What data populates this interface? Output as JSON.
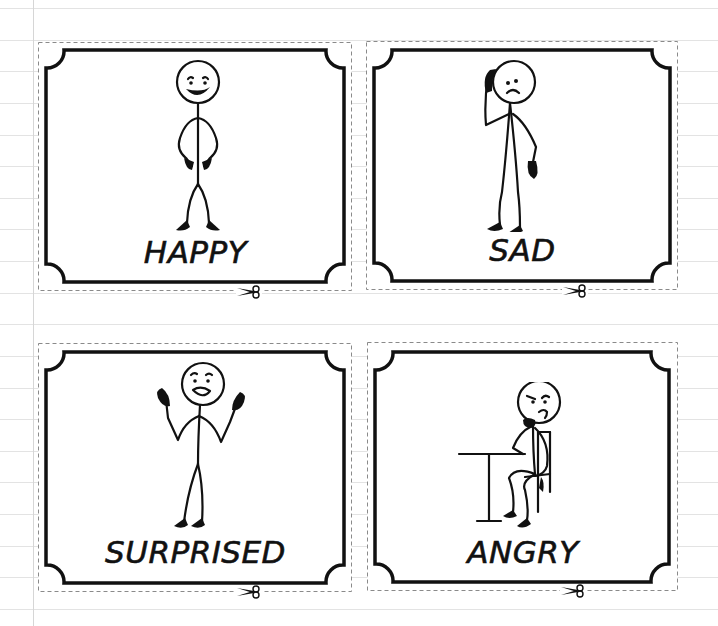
{
  "page": {
    "background": "#ffffff",
    "ruled_line_color": "#e3e3e3",
    "margin_line_color": "#d6d6d6",
    "ruled_line_positions": [
      8,
      40,
      71,
      103,
      135,
      166,
      198,
      229,
      261,
      293,
      324,
      356,
      388,
      419,
      451,
      482,
      514,
      546,
      577,
      609
    ],
    "margin_line_x": 33
  },
  "cards": [
    {
      "id": "happy",
      "label": "HAPPY",
      "figure": "standing-smiling-stick-figure-hands-on-hips",
      "icon": "scissors-icon"
    },
    {
      "id": "sad",
      "label": "SAD",
      "figure": "stick-figure-hand-on-head-frowning",
      "icon": "scissors-icon"
    },
    {
      "id": "surprised",
      "label": "SURPRISED",
      "figure": "stick-figure-arms-raised-open-mouth",
      "icon": "scissors-icon"
    },
    {
      "id": "angry",
      "label": "ANGRY",
      "figure": "stick-figure-sitting-at-table-frowning",
      "icon": "scissors-icon"
    }
  ],
  "colors": {
    "frame": "#111111",
    "dashed_cut_line": "#8a8a8a",
    "text": "#111111"
  }
}
